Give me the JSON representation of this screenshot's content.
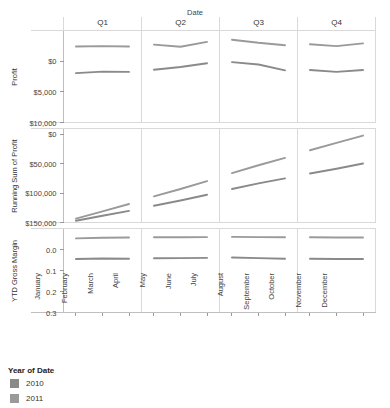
{
  "header": {
    "column_field_label": "Date",
    "column_headers": [
      "Q1",
      "Q2",
      "Q3",
      "Q4"
    ]
  },
  "legend": {
    "title": "Year of Date",
    "items": [
      {
        "label": "2010",
        "color": "#8a8a8a"
      },
      {
        "label": "2011",
        "color": "#9a9a9a"
      }
    ]
  },
  "axes": {
    "profit_title": "Profit",
    "profit_ticks": [
      "$10,000",
      "$5,000",
      "$0"
    ],
    "running_title": "Running Sum of Profit",
    "running_ticks": [
      "$150,000",
      "$100,000",
      "$50,000",
      "$0"
    ],
    "margin_title": "YTD Gross Margin",
    "margin_ticks": [
      "0.3",
      "0.2",
      "0.1",
      "0.0"
    ],
    "months": [
      "January",
      "February",
      "March",
      "April",
      "May",
      "June",
      "July",
      "August",
      "September",
      "October",
      "November",
      "December"
    ]
  },
  "chart_data": [
    {
      "type": "line",
      "title": "Profit",
      "ylabel": "Profit",
      "xlabel": "Date",
      "categories": [
        "January",
        "February",
        "March",
        "April",
        "May",
        "June",
        "July",
        "August",
        "September",
        "October",
        "November",
        "December"
      ],
      "panels": [
        "Q1",
        "Q2",
        "Q3",
        "Q4"
      ],
      "ylim": [
        0,
        15000
      ],
      "yticks": [
        0,
        5000,
        10000
      ],
      "ytick_labels": [
        "$0",
        "$5,000",
        "$10,000"
      ],
      "grid": true,
      "legend_position": "bottom-left",
      "series": [
        {
          "name": "2010",
          "color": "#8a8a8a",
          "values": [
            8050,
            8300,
            8250,
            8600,
            9050,
            9650,
            9850,
            9450,
            8500,
            8550,
            8250,
            8550
          ]
        },
        {
          "name": "2011",
          "color": "#9a9a9a",
          "values": [
            12400,
            12450,
            12400,
            12700,
            12350,
            13150,
            13500,
            13000,
            12600,
            12750,
            12450,
            12900
          ]
        }
      ]
    },
    {
      "type": "line",
      "title": "Running Sum of Profit",
      "ylabel": "Running Sum of Profit",
      "xlabel": "Date",
      "categories": [
        "January",
        "February",
        "March",
        "April",
        "May",
        "June",
        "July",
        "August",
        "September",
        "October",
        "November",
        "December"
      ],
      "panels": [
        "Q1",
        "Q2",
        "Q3",
        "Q4"
      ],
      "ylim": [
        0,
        160000
      ],
      "yticks": [
        0,
        50000,
        100000,
        150000
      ],
      "ytick_labels": [
        "$0",
        "$50,000",
        "$100,000",
        "$150,000"
      ],
      "grid": true,
      "legend_position": "bottom-left",
      "series": [
        {
          "name": "2010",
          "color": "#8a8a8a",
          "values": [
            3000,
            11500,
            19800,
            28500,
            37500,
            47200,
            57000,
            66500,
            75000,
            83500,
            91500,
            100500
          ]
        },
        {
          "name": "2011",
          "color": "#9a9a9a",
          "values": [
            6500,
            19000,
            31500,
            44500,
            57000,
            70500,
            84000,
            97500,
            110000,
            123000,
            135500,
            148000
          ]
        }
      ]
    },
    {
      "type": "line",
      "title": "YTD Gross Margin",
      "ylabel": "YTD Gross Margin",
      "xlabel": "Date",
      "categories": [
        "January",
        "February",
        "March",
        "April",
        "May",
        "June",
        "July",
        "August",
        "September",
        "October",
        "November",
        "December"
      ],
      "panels": [
        "Q1",
        "Q2",
        "Q3",
        "Q4"
      ],
      "ylim": [
        0,
        0.4
      ],
      "yticks": [
        0.0,
        0.1,
        0.2,
        0.3
      ],
      "ytick_labels": [
        "0.0",
        "0.1",
        "0.2",
        "0.3"
      ],
      "grid": true,
      "legend_position": "bottom-left",
      "series": [
        {
          "name": "2010",
          "color": "#8a8a8a",
          "values": [
            0.255,
            0.257,
            0.256,
            0.258,
            0.259,
            0.26,
            0.262,
            0.259,
            0.256,
            0.256,
            0.255,
            0.255
          ]
        },
        {
          "name": "2011",
          "color": "#9a9a9a",
          "values": [
            0.353,
            0.356,
            0.357,
            0.358,
            0.358,
            0.359,
            0.36,
            0.359,
            0.358,
            0.358,
            0.357,
            0.357
          ]
        }
      ]
    }
  ]
}
